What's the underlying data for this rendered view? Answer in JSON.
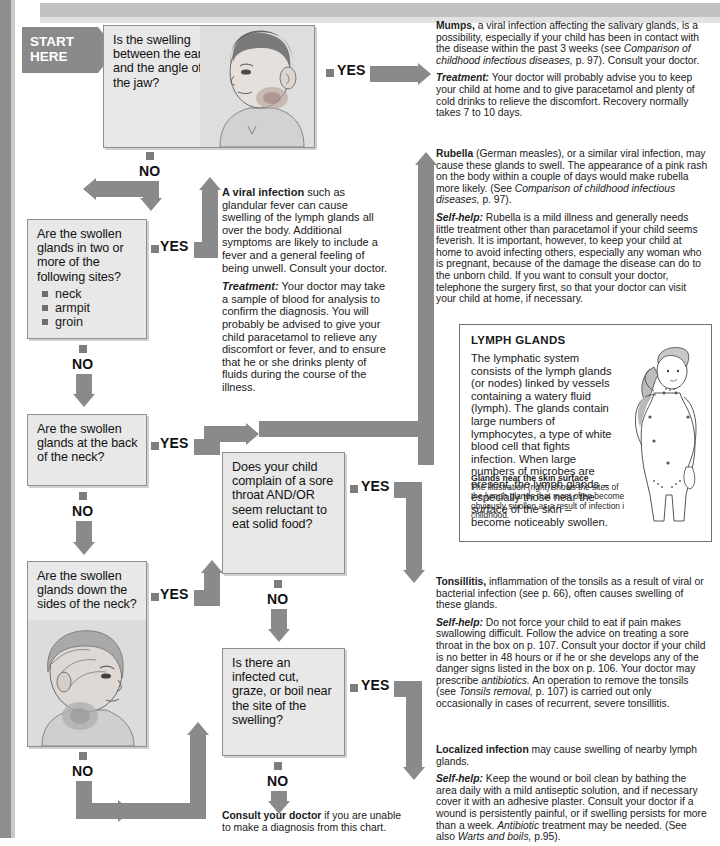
{
  "meta": {
    "accent_gray": "#8a8a8a",
    "box_fill": "#e8e8e8",
    "box_border": "#8f8f8f"
  },
  "start": {
    "line1": "START",
    "line2": "HERE"
  },
  "labels": {
    "yes": "YES",
    "no": "NO"
  },
  "questions": [
    {
      "id": "q1",
      "text": "Is the swelling between the ear and the angle of the jaw?",
      "illustration": "boy-head-side-swollen-jaw"
    },
    {
      "id": "q2",
      "text": "Are the swollen glands in two or more of the following sites?",
      "bullets": [
        "neck",
        "armpit",
        "groin"
      ]
    },
    {
      "id": "q3",
      "text": "Are the swollen glands at the back of the neck?"
    },
    {
      "id": "q4",
      "text": "Are the swollen glands down the sides of the neck?",
      "illustration": "girl-head-side-swollen-neck"
    },
    {
      "id": "q5",
      "text": "Does your child complain of a sore throat AND/OR seem reluctant to eat solid food?"
    },
    {
      "id": "q6",
      "text": "Is there an infected cut, graze, or boil near the site of the swelling?"
    }
  ],
  "advice": {
    "mumps": {
      "lead": "Mumps,",
      "p1_rest": " a viral infection affecting the salivary glands, is a possibility, especially if your child has been in contact with the disease within the past 3 weeks (see ",
      "p1_italic": "Comparison of childhood infectious diseases,",
      "p1_tail": " p. 97). Consult your doctor.",
      "p2_hdr": "Treatment:",
      "p2_rest": " Your doctor will probably advise you to keep your child at home and to give paracetamol and plenty of cold drinks to relieve the discomfort. Recovery normally takes 7 to 10 days."
    },
    "viral": {
      "lead": "A viral infection",
      "p1_rest": " such as glandular fever can cause swelling of the lymph glands all over the body. Additional symptoms are likely to include a fever and a general feeling of being unwell. Consult your doctor.",
      "p2_hdr": "Treatment:",
      "p2_rest": " Your doctor may take a sample of blood for analysis to confirm the diagnosis. You will probably be advised to give your child paracetamol to relieve any discomfort or fever, and to ensure that he or she drinks plenty of fluids during the course of the illness."
    },
    "rubella": {
      "lead": "Rubella",
      "p1_rest": " (German measles), or a similar viral infection, may cause these glands to swell. The appearance of a pink rash on the body within a couple of days would make rubella more likely. (See ",
      "p1_italic": "Comparison of childhood infectious diseases,",
      "p1_tail": " p. 97).",
      "p2_hdr": "Self-help:",
      "p2_rest": " Rubella is a mild illness and generally needs little treatment other than paracetamol if your child seems feverish. It is important, however, to keep your child at home to avoid infecting others, especially any woman who is pregnant, because of the damage the disease can do to the unborn child. If you want to consult your doctor, telephone the surgery first, so that your doctor can visit your child at home, if necessary."
    },
    "tonsillitis": {
      "lead": "Tonsillitis,",
      "p1_rest": " inflammation of the tonsils as a result of viral or bacterial infection (see p. 66), often causes swelling of these glands.",
      "p2_hdr": "Self-help:",
      "p2_a": " Do not force your child to eat if pain makes swallowing difficult. Follow the advice on treating a sore throat in the box on p. 107. Consult your doctor if your child is no better in 48 hours or if he or she develops any of the danger signs listed in the box on p. 106. Your doctor may prescribe ",
      "p2_i1": "antibiotics.",
      "p2_b": " An operation to remove the tonsils (see ",
      "p2_i2": "Tonsils removal,",
      "p2_c": " p. 107) is carried out only occasionally in cases of recurrent, severe tonsillitis."
    },
    "localized": {
      "lead": "Localized infection",
      "p1_rest": " may cause swelling of nearby lymph glands.",
      "p2_hdr": "Self-help:",
      "p2_a": " Keep the wound or boil clean by bathing the area daily with a mild antiseptic solution, and if necessary cover it with an adhesive plaster. Consult your doctor if a wound is persistently painful, or if swelling persists for more than a week. ",
      "p2_i1": "Antibiotic",
      "p2_b": " treatment may be needed. (See also ",
      "p2_i2": "Warts and boils,",
      "p2_c": " p.95)."
    }
  },
  "infobox": {
    "title": "LYMPH GLANDS",
    "body": "The lymphatic system consists of the lymph glands (or nodes) linked by vessels containing a watery fluid (lymph). The glands contain large numbers of lymphocytes, a type of white blood cell that fights infection. When large numbers of microbes are present, the lymph glands – especially those near the surface of the skin – become noticeably swollen.",
    "caption_title": "Glands near the skin surface",
    "caption_body": "The illustration (right) shows the sites of the lymph glands that most often become obviously swollen as a result of infection in childhood.",
    "illustration": "child-torso-lymph-node-sites"
  },
  "endnote": {
    "lead": "Consult your doctor",
    "rest": " if you are unable to make a diagnosis from this chart."
  }
}
